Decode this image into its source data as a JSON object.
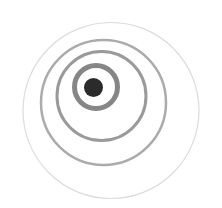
{
  "image": {
    "width": 222,
    "height": 208,
    "background": "#ffffff",
    "description": "Eccentric concentric rings around a dark dot"
  },
  "rings": [
    {
      "name": "outer-ring",
      "cx": 111,
      "cy": 110.5,
      "r": 88,
      "stroke": "#dcdcdc",
      "width": 1.2
    },
    {
      "name": "ring-4",
      "cx": 103.5,
      "cy": 102.5,
      "r": 62.5,
      "stroke": "#ababab",
      "width": 2.5
    },
    {
      "name": "ring-3",
      "cx": 101.5,
      "cy": 96,
      "r": 44.5,
      "stroke": "#9a9a9a",
      "width": 3
    },
    {
      "name": "ring-2",
      "cx": 96,
      "cy": 87,
      "r": 21.5,
      "stroke": "#868686",
      "width": 5
    }
  ],
  "center_dot": {
    "cx": 93.5,
    "cy": 87.5,
    "r": 9.5,
    "fill": "#2b2b2b"
  }
}
